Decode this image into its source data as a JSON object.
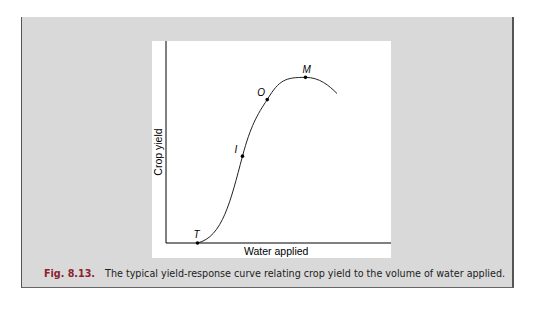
{
  "figure": {
    "number": "Fig. 8.13.",
    "caption": "The typical yield-response curve relating crop yield to the volume of water applied.",
    "x_axis_label": "Water applied",
    "y_axis_label": "Crop yield",
    "colors": {
      "panel": "#d9d9d9",
      "caption_number": "#8a2230",
      "curve": "#222222"
    }
  },
  "points": [
    {
      "label": "T",
      "x": 0.14,
      "y": 0.0
    },
    {
      "label": "I",
      "x": 0.34,
      "y": 0.43
    },
    {
      "label": "O",
      "x": 0.45,
      "y": 0.71
    },
    {
      "label": "M",
      "x": 0.62,
      "y": 0.82
    }
  ],
  "curve_end": {
    "x": 0.76,
    "y": 0.74
  }
}
